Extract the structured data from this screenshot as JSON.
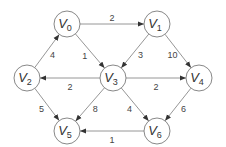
{
  "nodes": [
    {
      "id": "V0",
      "label": "V",
      "sub": "0",
      "x": 67,
      "y": 24
    },
    {
      "id": "V1",
      "label": "V",
      "sub": "1",
      "x": 157,
      "y": 24
    },
    {
      "id": "V2",
      "label": "V",
      "sub": "2",
      "x": 27,
      "y": 78
    },
    {
      "id": "V3",
      "label": "V",
      "sub": "3",
      "x": 113,
      "y": 78
    },
    {
      "id": "V4",
      "label": "V",
      "sub": "4",
      "x": 199,
      "y": 78
    },
    {
      "id": "V5",
      "label": "V",
      "sub": "5",
      "x": 67,
      "y": 131
    },
    {
      "id": "V6",
      "label": "V",
      "sub": "6",
      "x": 157,
      "y": 131
    }
  ],
  "edges": [
    {
      "from": "V0",
      "to": "V1",
      "weight": "2"
    },
    {
      "from": "V0",
      "to": "V3",
      "weight": "1"
    },
    {
      "from": "V2",
      "to": "V0",
      "weight": "4"
    },
    {
      "from": "V1",
      "to": "V3",
      "weight": "3"
    },
    {
      "from": "V1",
      "to": "V4",
      "weight": "10"
    },
    {
      "from": "V3",
      "to": "V2",
      "weight": "2"
    },
    {
      "from": "V3",
      "to": "V4",
      "weight": "2"
    },
    {
      "from": "V3",
      "to": "V5",
      "weight": "8"
    },
    {
      "from": "V3",
      "to": "V6",
      "weight": "4"
    },
    {
      "from": "V2",
      "to": "V5",
      "weight": "5"
    },
    {
      "from": "V4",
      "to": "V6",
      "weight": "6"
    },
    {
      "from": "V6",
      "to": "V5",
      "weight": "1"
    }
  ]
}
